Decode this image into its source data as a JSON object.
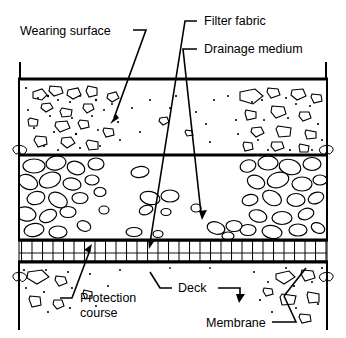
{
  "figure": {
    "kind": "engineering-cross-section",
    "background_color": "#ffffff",
    "line_color": "#000000"
  },
  "labels": {
    "wearing_surface": "Wearing surface",
    "filter_fabric": "Filter fabric",
    "drainage_medium": "Drainage medium",
    "protection_course_line1": "Protection",
    "protection_course_line2": "course",
    "deck": "Deck",
    "membrane": "Membrane"
  },
  "layers": [
    {
      "name": "wearing-surface",
      "label": "Wearing surface",
      "order": 1,
      "fill_pattern": "angular-aggregate-stipple",
      "top_y": 79,
      "bottom_y": 155
    },
    {
      "name": "drainage-medium",
      "label": "Drainage medium",
      "order": 2,
      "fill_pattern": "rounded-cobbles",
      "top_y": 155,
      "bottom_y": 240
    },
    {
      "name": "protection-course",
      "label": "Protection course",
      "order": 3,
      "fill_pattern": "grid-hatch",
      "top_y": 240,
      "bottom_y": 262
    },
    {
      "name": "deck",
      "label": "Deck",
      "order": 4,
      "fill_pattern": "angular-aggregate-stipple",
      "top_y": 262,
      "bottom_y": 330
    }
  ],
  "interfaces": [
    {
      "name": "filter-fabric",
      "label": "Filter fabric",
      "at_y": 155
    },
    {
      "name": "membrane",
      "label": "Membrane",
      "at_y": 262
    }
  ],
  "extents": {
    "left_x": 18,
    "right_x": 328,
    "tick_top_y": 62
  }
}
